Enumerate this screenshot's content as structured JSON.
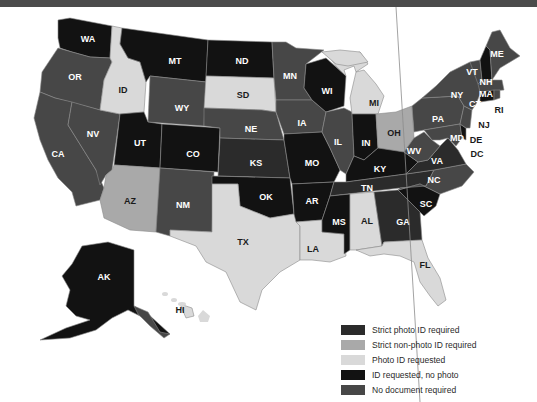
{
  "banner": {
    "color": "#4b4b4b"
  },
  "colors": {
    "strict_photo": "#2b2b2b",
    "strict_nonphoto": "#a9a9a9",
    "photo_requested": "#d9d9d9",
    "id_no_photo": "#121212",
    "no_document": "#474747"
  },
  "legend": {
    "items": [
      {
        "key": "strict_photo",
        "label": "Strict photo ID required",
        "color": "#2b2b2b"
      },
      {
        "key": "strict_nonphoto",
        "label": "Strict non-photo ID required",
        "color": "#a9a9a9"
      },
      {
        "key": "photo_requested",
        "label": "Photo ID requested",
        "color": "#d9d9d9"
      },
      {
        "key": "id_no_photo",
        "label": "ID requested, no photo",
        "color": "#121212"
      },
      {
        "key": "no_document",
        "label": "No document required",
        "color": "#474747"
      }
    ]
  },
  "states": {
    "WA": "WA",
    "OR": "OR",
    "CA": "CA",
    "ID": "ID",
    "NV": "NV",
    "MT": "MT",
    "WY": "WY",
    "UT": "UT",
    "AZ": "AZ",
    "CO": "CO",
    "NM": "NM",
    "ND": "ND",
    "SD": "SD",
    "NE": "NE",
    "KS": "KS",
    "OK": "OK",
    "TX": "TX",
    "MN": "MN",
    "IA": "IA",
    "MO": "MO",
    "AR": "AR",
    "LA": "LA",
    "WI": "WI",
    "IL": "IL",
    "MI": "MI",
    "IN": "IN",
    "OH": "OH",
    "KY": "KY",
    "TN": "TN",
    "MS": "MS",
    "AL": "AL",
    "GA": "GA",
    "FL": "FL",
    "SC": "SC",
    "NC": "NC",
    "VA": "VA",
    "WV": "WV",
    "PA": "PA",
    "NY": "NY",
    "VT": "VT",
    "NH": "NH",
    "ME": "ME",
    "MA": "MA",
    "CT": "CT",
    "RI": "RI",
    "NJ": "NJ",
    "DE": "DE",
    "MD": "MD",
    "DC": "DC",
    "AK": "AK",
    "HI": "HI"
  }
}
